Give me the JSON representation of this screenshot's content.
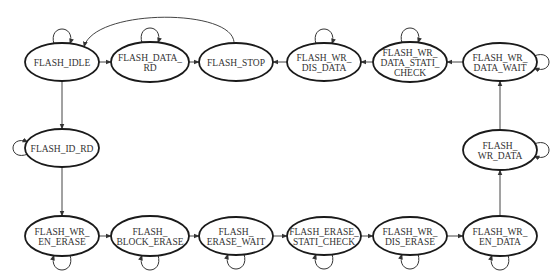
{
  "diagram": {
    "type": "state-machine",
    "colors": {
      "stroke": "#1a1a1a",
      "edge": "#444444",
      "text": "#333333",
      "background": "#ffffff"
    },
    "nodes": [
      {
        "id": "FLASH_IDLE",
        "lines": [
          "FLASH_IDLE"
        ],
        "cx": 62,
        "cy": 62,
        "rx": 37,
        "ry": 19,
        "self_loop": "top"
      },
      {
        "id": "FLASH_DATA_RD",
        "lines": [
          "FLASH_DATA_",
          "RD"
        ],
        "cx": 150,
        "cy": 62,
        "rx": 39,
        "ry": 20,
        "self_loop": "top"
      },
      {
        "id": "FLASH_STOP",
        "lines": [
          "FLASH_STOP"
        ],
        "cx": 236,
        "cy": 62,
        "rx": 37,
        "ry": 19,
        "self_loop": "none"
      },
      {
        "id": "FLASH_WR_DIS_DATA",
        "lines": [
          "FLASH_WR_",
          "DIS_DATA"
        ],
        "cx": 324,
        "cy": 62,
        "rx": 37,
        "ry": 19,
        "self_loop": "top"
      },
      {
        "id": "FLASH_WR_DATA_STATI_CHECK",
        "lines": [
          "FLASH_WR_",
          "DATA_STATI_",
          "CHECK"
        ],
        "cx": 410,
        "cy": 62,
        "rx": 37,
        "ry": 20,
        "self_loop": "top"
      },
      {
        "id": "FLASH_WR_DATA_WAIT",
        "lines": [
          "FLASH_WR_",
          "DATA_WAIT"
        ],
        "cx": 500,
        "cy": 62,
        "rx": 37,
        "ry": 19,
        "self_loop": "right"
      },
      {
        "id": "FLASH_ID_RD",
        "lines": [
          "FLASH_ID_RD"
        ],
        "cx": 62,
        "cy": 148,
        "rx": 37,
        "ry": 19,
        "self_loop": "left"
      },
      {
        "id": "FLASH_WR_DATA",
        "lines": [
          "FLASH_",
          "WR_DATA"
        ],
        "cx": 500,
        "cy": 150,
        "rx": 37,
        "ry": 20,
        "self_loop": "right"
      },
      {
        "id": "FLASH_WR_EN_ERASE",
        "lines": [
          "FLASH_WR_",
          "EN_ERASE"
        ],
        "cx": 62,
        "cy": 236,
        "rx": 37,
        "ry": 20,
        "self_loop": "bottom"
      },
      {
        "id": "FLASH_BLOCK_ERASE",
        "lines": [
          "FLASH_",
          "BLOCK_ERASE"
        ],
        "cx": 150,
        "cy": 236,
        "rx": 39,
        "ry": 20,
        "self_loop": "bottom"
      },
      {
        "id": "FLASH_ERASE_WAIT",
        "lines": [
          "FLASH_",
          "ERASE_WAIT"
        ],
        "cx": 236,
        "cy": 236,
        "rx": 37,
        "ry": 19,
        "self_loop": "bottom"
      },
      {
        "id": "FLASH_ERASE_STATI_CHECK",
        "lines": [
          "FLASH_ERASE_",
          "STATI_CHECK"
        ],
        "cx": 324,
        "cy": 236,
        "rx": 37,
        "ry": 19,
        "self_loop": "bottom"
      },
      {
        "id": "FLASH_WR_DIS_ERASE",
        "lines": [
          "FLASH_WR_",
          "DIS_ERASE"
        ],
        "cx": 410,
        "cy": 236,
        "rx": 37,
        "ry": 19,
        "self_loop": "bottom"
      },
      {
        "id": "FLASH_WR_EN_DATA",
        "lines": [
          "FLASH_WR_",
          "EN_DATA"
        ],
        "cx": 500,
        "cy": 236,
        "rx": 37,
        "ry": 20,
        "self_loop": "bottom"
      }
    ],
    "edges": [
      {
        "from": "FLASH_IDLE",
        "to": "FLASH_DATA_RD"
      },
      {
        "from": "FLASH_DATA_RD",
        "to": "FLASH_STOP"
      },
      {
        "from": "FLASH_STOP",
        "to": "FLASH_IDLE",
        "curved": true
      },
      {
        "from": "FLASH_WR_DIS_DATA",
        "to": "FLASH_STOP"
      },
      {
        "from": "FLASH_WR_DATA_STATI_CHECK",
        "to": "FLASH_WR_DIS_DATA"
      },
      {
        "from": "FLASH_WR_DATA_WAIT",
        "to": "FLASH_WR_DATA_STATI_CHECK"
      },
      {
        "from": "FLASH_IDLE",
        "to": "FLASH_ID_RD"
      },
      {
        "from": "FLASH_ID_RD",
        "to": "FLASH_WR_EN_ERASE"
      },
      {
        "from": "FLASH_WR_EN_ERASE",
        "to": "FLASH_BLOCK_ERASE"
      },
      {
        "from": "FLASH_BLOCK_ERASE",
        "to": "FLASH_ERASE_WAIT"
      },
      {
        "from": "FLASH_ERASE_WAIT",
        "to": "FLASH_ERASE_STATI_CHECK"
      },
      {
        "from": "FLASH_ERASE_STATI_CHECK",
        "to": "FLASH_WR_DIS_ERASE"
      },
      {
        "from": "FLASH_WR_DIS_ERASE",
        "to": "FLASH_WR_EN_DATA"
      },
      {
        "from": "FLASH_WR_EN_DATA",
        "to": "FLASH_WR_DATA"
      },
      {
        "from": "FLASH_WR_DATA",
        "to": "FLASH_WR_DATA_WAIT"
      }
    ]
  }
}
